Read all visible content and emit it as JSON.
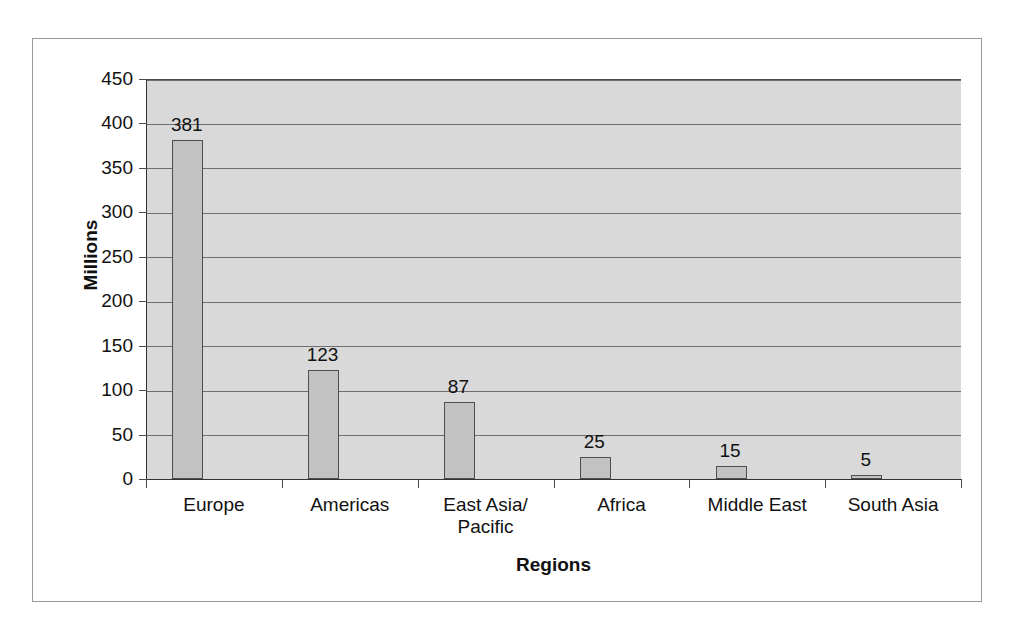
{
  "chart_data": {
    "type": "bar",
    "title": "",
    "subtitle": "",
    "xlabel": "Regions",
    "ylabel": "Millions",
    "categories": [
      "Europe",
      "Americas",
      "East Asia/\nPacific",
      "Africa",
      "Middle East",
      "South Asia"
    ],
    "values": [
      381,
      123,
      87,
      25,
      15,
      5
    ],
    "data_labels": [
      "381",
      "123",
      "87",
      "25",
      "15",
      "5"
    ],
    "ylim": [
      0,
      450
    ],
    "ytick_values": [
      0,
      50,
      100,
      150,
      200,
      250,
      300,
      350,
      400,
      450
    ],
    "ytick_labels": [
      "0",
      "50",
      "100",
      "150",
      "200",
      "250",
      "300",
      "350",
      "400",
      "450"
    ],
    "grid": "horizontal",
    "legend": "none",
    "colors": {
      "bar_fill": "#c2c2c2",
      "bar_border": "#4f4f4f",
      "plot_background": "#d9d9d9",
      "gridline": "#6e6e6e",
      "axis": "#333333",
      "text": "#111111",
      "frame_border": "#9a9a9a",
      "page_background": "#ffffff"
    }
  }
}
